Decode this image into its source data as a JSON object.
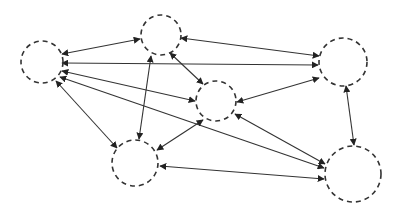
{
  "diagram": {
    "type": "network-graph",
    "directed": true,
    "bidirectional_edges": true,
    "colors": {
      "stroke": "#333333",
      "background": "#ffffff"
    },
    "nodes": [
      {
        "id": "A",
        "label": "",
        "cx": 42,
        "cy": 62,
        "r": 21,
        "style": "dashed-circle"
      },
      {
        "id": "B",
        "label": "",
        "cx": 161,
        "cy": 35,
        "r": 20,
        "style": "dashed-circle"
      },
      {
        "id": "C",
        "label": "",
        "cx": 343,
        "cy": 62,
        "r": 24,
        "style": "dashed-circle"
      },
      {
        "id": "D",
        "label": "",
        "cx": 216,
        "cy": 101,
        "r": 20,
        "style": "dashed-circle"
      },
      {
        "id": "E",
        "label": "",
        "cx": 135,
        "cy": 163,
        "r": 23,
        "style": "dashed-circle"
      },
      {
        "id": "F",
        "label": "",
        "cx": 353,
        "cy": 174,
        "r": 28,
        "style": "dashed-circle"
      }
    ],
    "edges": [
      {
        "from": "A",
        "to": "B",
        "x1": 62,
        "y1": 54,
        "x2": 140,
        "y2": 39,
        "arrows": "both"
      },
      {
        "from": "A",
        "to": "C",
        "x1": 62,
        "y1": 63,
        "x2": 318,
        "y2": 65,
        "arrows": "both"
      },
      {
        "from": "A",
        "to": "D",
        "x1": 62,
        "y1": 71,
        "x2": 195,
        "y2": 101,
        "arrows": "both"
      },
      {
        "from": "A",
        "to": "F",
        "x1": 60,
        "y1": 77,
        "x2": 324,
        "y2": 168,
        "arrows": "both"
      },
      {
        "from": "A",
        "to": "E",
        "x1": 56,
        "y1": 81,
        "x2": 117,
        "y2": 148,
        "arrows": "both"
      },
      {
        "from": "B",
        "to": "C",
        "x1": 181,
        "y1": 38,
        "x2": 319,
        "y2": 56,
        "arrows": "both"
      },
      {
        "from": "B",
        "to": "D",
        "x1": 170,
        "y1": 53,
        "x2": 203,
        "y2": 84,
        "arrows": "both"
      },
      {
        "from": "B",
        "to": "E",
        "x1": 151,
        "y1": 56,
        "x2": 139,
        "y2": 139,
        "arrows": "both"
      },
      {
        "from": "D",
        "to": "C",
        "x1": 237,
        "y1": 102,
        "x2": 319,
        "y2": 78,
        "arrows": "both"
      },
      {
        "from": "D",
        "to": "E",
        "x1": 203,
        "y1": 120,
        "x2": 157,
        "y2": 150,
        "arrows": "both"
      },
      {
        "from": "D",
        "to": "F",
        "x1": 235,
        "y1": 114,
        "x2": 325,
        "y2": 164,
        "arrows": "both"
      },
      {
        "from": "E",
        "to": "F",
        "x1": 160,
        "y1": 166,
        "x2": 324,
        "y2": 179,
        "arrows": "both"
      },
      {
        "from": "C",
        "to": "F",
        "x1": 346,
        "y1": 86,
        "x2": 354,
        "y2": 145,
        "arrows": "both"
      }
    ]
  }
}
